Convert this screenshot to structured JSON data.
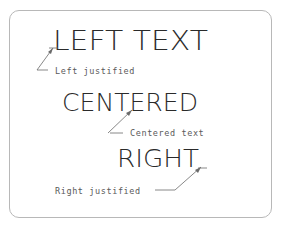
{
  "diagram": {
    "examples": [
      {
        "text": "LEFT TEXT",
        "annotation": "Left justified",
        "justification": "left"
      },
      {
        "text": "CENTERED",
        "annotation": "Centered text",
        "justification": "center"
      },
      {
        "text": "RIGHT",
        "annotation": "Right justified",
        "justification": "right"
      }
    ],
    "colors": {
      "text": "#2a2a2a",
      "annotation": "#5a5a5a",
      "border": "#b8b8b8"
    }
  }
}
